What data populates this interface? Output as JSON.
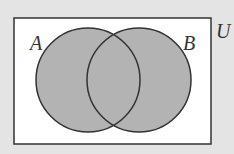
{
  "diagram": {
    "type": "venn",
    "universe_label": "U",
    "sets": [
      {
        "label": "A",
        "shaded": true
      },
      {
        "label": "B",
        "shaded": true
      }
    ],
    "shaded_region": "A ∪ B",
    "colors": {
      "background": "#e4e4e4",
      "universe_fill": "#ffffff",
      "set_fill": "#b3b3b3",
      "stroke": "#333333"
    }
  }
}
